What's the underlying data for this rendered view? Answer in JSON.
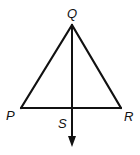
{
  "figure": {
    "type": "geometry-triangle-with-ray",
    "stroke_color": "#111111",
    "background": "#ffffff"
  },
  "labels": {
    "apex": "Q",
    "left": "P",
    "right": "R",
    "ray_point": "S"
  },
  "segments": [
    {
      "name": "QP",
      "from": "Q",
      "to": "P"
    },
    {
      "name": "QR",
      "from": "Q",
      "to": "R"
    },
    {
      "name": "PR",
      "from": "P",
      "to": "R"
    }
  ],
  "rays": [
    {
      "name": "QS",
      "from": "Q",
      "through": "S",
      "arrow": true
    }
  ]
}
